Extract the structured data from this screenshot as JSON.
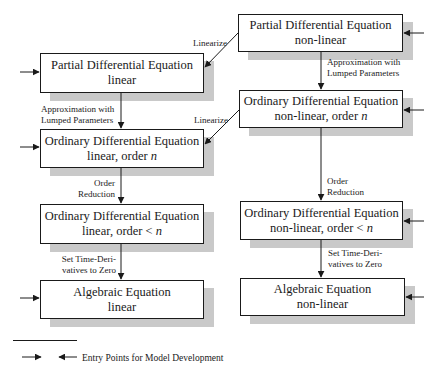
{
  "diagram": {
    "type": "flowchart",
    "boxes": {
      "pde_nonlinear": {
        "line1": "Partial Differential Equation",
        "line2": "non-linear"
      },
      "pde_linear": {
        "line1": "Partial Differential Equation",
        "line2": "linear"
      },
      "ode_nonlinear_n": {
        "line1": "Ordinary Differential Equation",
        "line2_prefix": "non-linear, order ",
        "line2_var": "n"
      },
      "ode_linear_n": {
        "line1": "Ordinary Differential Equation",
        "line2_prefix": "linear, order ",
        "line2_var": "n"
      },
      "ode_linear_lt_n": {
        "line1": "Ordinary Differential Equation",
        "line2_prefix": "linear, order < ",
        "line2_var": "n"
      },
      "ode_nonlinear_lt_n": {
        "line1": "Ordinary Differential Equation",
        "line2_prefix": "non-linear, order < ",
        "line2_var": "n"
      },
      "alg_linear": {
        "line1": "Algebraic Equation",
        "line2": "linear"
      },
      "alg_nonlinear": {
        "line1": "Algebraic Equation",
        "line2": "non-linear"
      }
    },
    "edge_labels": {
      "linearize_top": "Linearize",
      "linearize_mid": "Linearize",
      "approx_left_1": "Approximation with",
      "approx_left_2": "Lumped Parameters",
      "approx_right_1": "Approximation with",
      "approx_right_2": "Lumped Parameters",
      "order_red_left_1": "Order",
      "order_red_left_2": "Reduction",
      "order_red_right_1": "Order",
      "order_red_right_2": "Reduction",
      "set_time_left_1": "Set Time-Deri-",
      "set_time_left_2": "vatives to Zero",
      "set_time_right_1": "Set Time-Deri-",
      "set_time_right_2": "vatives to Zero"
    },
    "legend": {
      "text": "Entry Points for Model Development"
    },
    "colors": {
      "stroke": "#1a1a1a",
      "shadow": "#c9c9c9",
      "background": "#ffffff"
    }
  }
}
